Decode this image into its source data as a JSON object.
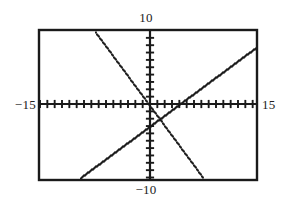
{
  "screen": {
    "kind": "graphing-calculator-plot",
    "background": "#ffffff",
    "ink": "#1a1a1a"
  },
  "labels": {
    "top": "10",
    "bottom": "−10",
    "left": "−15",
    "right": "15"
  },
  "chart_data": {
    "type": "line",
    "title": "",
    "xlabel": "",
    "ylabel": "",
    "xlim": [
      -15,
      15
    ],
    "ylim": [
      -10,
      10
    ],
    "grid": false,
    "legend": "none",
    "axis_style": "tick-marked crosshair axes",
    "x_tick_step": 1,
    "y_tick_step": 1,
    "x_tick_count": 30,
    "y_tick_count": 20,
    "annotations": [
      {
        "text": "10",
        "position": "top-outside-center",
        "value": 10
      },
      {
        "text": "−10",
        "position": "bottom-outside-center",
        "value": -10
      },
      {
        "text": "−15",
        "position": "left-outside-middle",
        "value": -15
      },
      {
        "text": "15",
        "position": "right-outside-middle",
        "value": 15
      }
    ],
    "series": [
      {
        "name": "descending-line",
        "style": "dotted",
        "slope": -1.35,
        "intercept": -0.35,
        "x": [
          -7.0,
          -5.0,
          -3.0,
          -1.0,
          0.0,
          1.0,
          3.0,
          5.0,
          7.9
        ],
        "y": [
          9.1,
          6.4,
          3.7,
          1.0,
          -0.35,
          -1.7,
          -4.4,
          -7.1,
          -11.0
        ],
        "x_intercept": -0.26,
        "y_intercept": -0.35
      },
      {
        "name": "ascending-line",
        "style": "dotted",
        "slope": 0.74,
        "intercept": -2.95,
        "x": [
          -9.9,
          -7.0,
          -5.0,
          -3.0,
          0.0,
          4.0,
          7.0,
          14.0
        ],
        "y": [
          -10.3,
          -8.1,
          -6.65,
          -5.2,
          -2.95,
          0.0,
          2.2,
          7.4
        ],
        "x_intercept": 4.0,
        "y_intercept": -2.95
      }
    ],
    "intersection": {
      "x": -0.25,
      "y": -3.14
    }
  },
  "plot_geometry": {
    "frame_left": 38,
    "frame_top": 29,
    "frame_right": 258,
    "frame_bottom": 181,
    "origin_x": 150,
    "origin_y": 104,
    "px_per_unit_x": 7.333,
    "px_per_unit_y": 7.35
  }
}
